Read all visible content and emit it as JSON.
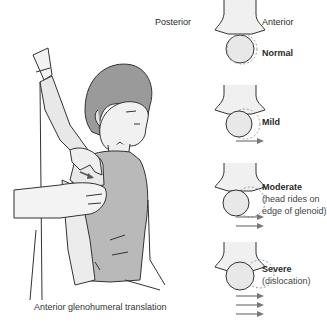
{
  "header": {
    "posterior_label": "Posterior",
    "anterior_label": "Anterior"
  },
  "illustration": {
    "caption": "Anterior glenohumeral translation"
  },
  "grades": [
    {
      "title": "Normal",
      "detail": [],
      "arrows": 0
    },
    {
      "title": "Mild",
      "detail": [],
      "arrows": 1
    },
    {
      "title": "Moderate",
      "detail": [
        "(head rides on",
        "edge of glenoid)"
      ],
      "arrows": 2
    },
    {
      "title": "Severe",
      "detail": [
        "(dislocation)"
      ],
      "arrows": 3
    }
  ],
  "colors": {
    "line": "#333333",
    "fill": "#e6e6e6",
    "shirt": "#b9b9b9",
    "hair": "#9a9a9a",
    "arrow": "#777777",
    "dashed": "#9a9a9a"
  }
}
